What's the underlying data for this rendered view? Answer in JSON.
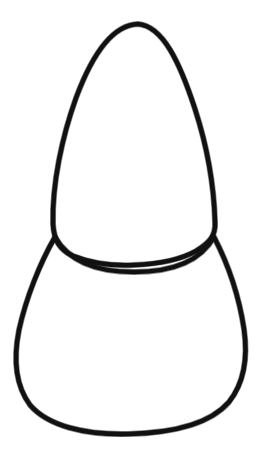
{
  "document": {
    "title": "Line drawing outline",
    "subject": "two-part rounded outline (upper dome over lower rounded body)",
    "background_color": "#ffffff",
    "ink_color": "#111111",
    "canvas": {
      "width": 263,
      "height": 457
    }
  },
  "drawing": {
    "style": "hand-drawn black outline, no fill, no text labels",
    "stroke_width_px": 4.6,
    "shapes": [
      {
        "name": "upper-dome",
        "description": "tall egg / dome shape, rounded apex at top, widening downward, closed by a shallow upward-curving base arc",
        "apex": {
          "x": 138,
          "y": 24
        },
        "left_extreme": {
          "x": 52,
          "y": 215
        },
        "right_extreme": {
          "x": 215,
          "y": 228
        },
        "base_arc_low_point": {
          "x": 133,
          "y": 263
        },
        "path": "M 138 24 C 112 25 92 55 76 98 C 62 137 52 184 53 224 C 54 241 60 250 73 256 C 93 264 114 266 134 265 C 158 264 180 260 196 251 C 209 243 216 236 215 222 C 214 186 207 146 195 109 C 180 63 163 26 138 24 Z"
      },
      {
        "name": "lower-body",
        "description": "wide rounded body, widest near mid-height, flat-bottomed rounded base, apex points meeting the upper dome at the two junctions",
        "left_junction": {
          "x": 55,
          "y": 237
        },
        "right_junction": {
          "x": 214,
          "y": 237
        },
        "left_extreme": {
          "x": 17,
          "y": 345
        },
        "right_extreme": {
          "x": 247,
          "y": 340
        },
        "bottom": {
          "x": 130,
          "y": 433
        },
        "path": "M 55 237 C 40 263 26 298 19 330 C 13 360 16 386 30 405 C 48 426 85 435 128 434 C 172 433 210 424 229 402 C 244 383 248 357 244 329 C 239 296 227 262 214 237 C 200 262 172 272 134 272 C 96 272 69 262 55 237 Z"
      }
    ],
    "junction_points": [
      {
        "name": "left-junction",
        "x": 55,
        "y": 237
      },
      {
        "name": "right-junction",
        "x": 214,
        "y": 237
      }
    ]
  }
}
